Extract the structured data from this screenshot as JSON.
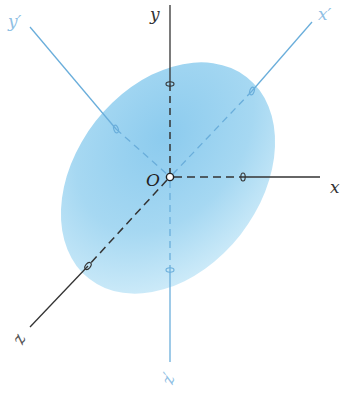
{
  "diagram": {
    "type": "3d-coordinate-axes-with-ellipsoid",
    "colors": {
      "body_fill": "#9fd4f0",
      "body_fill_edge": "#c9e8f8",
      "reference_axis": "#333333",
      "principal_axis": "#6aaedb",
      "principal_label": "#7fb8e0",
      "reference_label": "#222222"
    },
    "origin": {
      "label": "O"
    },
    "reference_axes": [
      {
        "id": "x",
        "label": "x"
      },
      {
        "id": "y",
        "label": "y"
      },
      {
        "id": "z",
        "label": "z"
      }
    ],
    "principal_axes": [
      {
        "id": "x-prime",
        "label": "x′"
      },
      {
        "id": "y-prime",
        "label": "y′"
      },
      {
        "id": "z-prime",
        "label": "z′"
      }
    ]
  }
}
